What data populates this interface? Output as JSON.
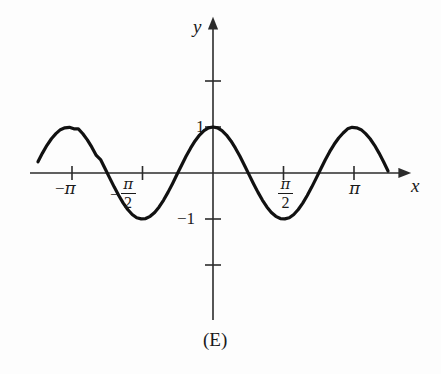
{
  "figure": {
    "caption": "(E)",
    "background_color": "#fdfdfd",
    "curve_color": "#111111",
    "axis_color": "#2b2b2b"
  },
  "axes": {
    "x_axis_label": "x",
    "y_axis_label": "y",
    "x_ticks": [
      {
        "value": -3.14159,
        "label_minus": "−",
        "label_pi": "π",
        "kind": "pi"
      },
      {
        "value": -1.5708,
        "label_minus": "−",
        "label_pi": "π",
        "label_den": "2",
        "kind": "fraction"
      },
      {
        "value": 1.5708,
        "label_minus": "",
        "label_pi": "π",
        "label_den": "2",
        "kind": "fraction"
      },
      {
        "value": 3.14159,
        "label_minus": "",
        "label_pi": "π",
        "kind": "pi"
      }
    ],
    "y_ticks": [
      {
        "value": 2,
        "label": ""
      },
      {
        "value": 1,
        "label": "1"
      },
      {
        "value": -1,
        "label": "−1"
      },
      {
        "value": -2,
        "label": ""
      }
    ],
    "x_range": [
      -4.05,
      4.3
    ],
    "y_range": [
      -3.25,
      3.45
    ],
    "arrow_on_positive_x": true,
    "arrow_on_positive_y": true,
    "grid": false
  },
  "chart_data": {
    "type": "line",
    "title": "",
    "subtitle": "",
    "xlabel": "x",
    "ylabel": "y",
    "caption": "(E)",
    "function_expression": "y = cos(2x)",
    "amplitude": 1,
    "period": 3.14159,
    "xlim": [
      -3.9,
      3.93
    ],
    "ylim": [
      -3.25,
      3.45
    ],
    "x_tick_labels": [
      "−π",
      "−π/2",
      "π/2",
      "π"
    ],
    "x_tick_values": [
      -3.14159,
      -1.5708,
      1.5708,
      3.14159
    ],
    "y_tick_labels": [
      "1",
      "−1"
    ],
    "y_tick_values": [
      1,
      -1
    ],
    "grid": false,
    "legend": [],
    "legend_position": "none",
    "series": [
      {
        "name": "cos(2x)",
        "x": [
          -3.9,
          -3.8,
          -3.7,
          -3.6,
          -3.5,
          -3.4,
          -3.3,
          -3.2,
          -3.1,
          -3.0,
          -2.9,
          -2.8,
          -2.7,
          -2.6,
          -2.5,
          -2.4,
          -2.3,
          -2.2,
          -2.1,
          -2.0,
          -1.9,
          -1.8,
          -1.7,
          -1.6,
          -1.5,
          -1.4,
          -1.3,
          -1.2,
          -1.1,
          -1.0,
          -0.9,
          -0.8,
          -0.7,
          -0.6,
          -0.5,
          -0.4,
          -0.3,
          -0.2,
          -0.1,
          0.0,
          0.1,
          0.2,
          0.3,
          0.4,
          0.5,
          0.6,
          0.7,
          0.8,
          0.9,
          1.0,
          1.1,
          1.2,
          1.3,
          1.4,
          1.5,
          1.6,
          1.7,
          1.8,
          1.9,
          2.0,
          2.1,
          2.2,
          2.3,
          2.4,
          2.5,
          2.6,
          2.7,
          2.8,
          2.9,
          3.0,
          3.1,
          3.2,
          3.3,
          3.4,
          3.5,
          3.6,
          3.7,
          3.8,
          3.9
        ],
        "y": [
          0.243,
          0.433,
          0.602,
          0.745,
          0.855,
          0.942,
          0.982,
          0.993,
          0.961,
          0.96,
          0.854,
          0.721,
          0.561,
          0.381,
          0.284,
          0.087,
          -0.112,
          -0.307,
          -0.49,
          -0.654,
          -0.793,
          -0.901,
          -0.974,
          -0.998,
          -0.99,
          -0.942,
          -0.857,
          -0.737,
          -0.588,
          -0.416,
          -0.227,
          -0.029,
          0.17,
          0.362,
          0.54,
          0.697,
          0.825,
          0.921,
          0.98,
          1.0,
          0.98,
          0.921,
          0.825,
          0.697,
          0.54,
          0.362,
          0.17,
          -0.029,
          -0.227,
          -0.416,
          -0.588,
          -0.737,
          -0.857,
          -0.942,
          -0.99,
          -0.998,
          -0.974,
          -0.901,
          -0.793,
          -0.654,
          -0.49,
          -0.307,
          -0.112,
          0.087,
          0.284,
          0.463,
          0.624,
          0.761,
          0.869,
          0.96,
          0.993,
          0.982,
          0.942,
          0.855,
          0.745,
          0.602,
          0.433,
          0.243,
          0.042
        ],
        "color": "#111111",
        "linewidth": 3.2,
        "style": "solid"
      }
    ],
    "annotations": []
  },
  "geometry": {
    "origin_x": 213,
    "origin_y": 173,
    "px_per_pi": 141,
    "px_per_unit": 46
  }
}
